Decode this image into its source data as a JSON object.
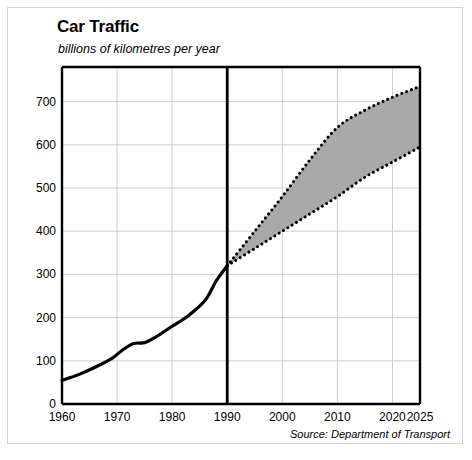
{
  "figure": {
    "title": "Car Traffic",
    "subtitle": "billions of kilometres per year",
    "source": "Source: Department of Transport"
  },
  "chart_data": {
    "type": "area",
    "title": "Car Traffic",
    "subtitle": "billions of kilometres per year",
    "xlabel": "",
    "ylabel": "billions of kilometres per year",
    "xlim": [
      1960,
      2025
    ],
    "ylim": [
      0,
      780
    ],
    "yticks": [
      0,
      100,
      200,
      300,
      400,
      500,
      600,
      700
    ],
    "ytick_labels": [
      "0",
      "100",
      "200",
      "300",
      "400",
      "500",
      "600",
      "700"
    ],
    "xticks": [
      1960,
      1970,
      1980,
      1990,
      2000,
      2010,
      2020,
      2025
    ],
    "xtick_labels": [
      "1960",
      "1970",
      "1980",
      "1990",
      "2000",
      "2010",
      "2020",
      "2025"
    ],
    "grid": true,
    "legend": "none",
    "annotations": [
      {
        "label": "forecast-divider",
        "x": 1990,
        "style": "thick-vertical-line"
      }
    ],
    "series": [
      {
        "name": "Actual car traffic",
        "style": "solid-line",
        "x": [
          1960,
          1963,
          1966,
          1969,
          1971,
          1973,
          1975,
          1977,
          1980,
          1983,
          1986,
          1988,
          1990
        ],
        "values": [
          55,
          68,
          85,
          105,
          125,
          140,
          142,
          155,
          180,
          205,
          240,
          285,
          320
        ]
      },
      {
        "name": "Forecast high",
        "style": "dotted-line",
        "x": [
          1990,
          1995,
          2000,
          2005,
          2010,
          2015,
          2020,
          2025
        ],
        "values": [
          320,
          400,
          480,
          565,
          640,
          680,
          710,
          735
        ]
      },
      {
        "name": "Forecast low",
        "style": "dotted-line",
        "x": [
          1990,
          1995,
          2000,
          2005,
          2010,
          2015,
          2020,
          2025
        ],
        "values": [
          320,
          360,
          400,
          440,
          480,
          525,
          560,
          595
        ]
      }
    ],
    "shaded_band": {
      "between": [
        "Forecast low",
        "Forecast high"
      ],
      "fill_color": "#a9a9a9"
    },
    "colors": {
      "line": "#000000",
      "band_fill": "#a9a9a9",
      "grid": "#cfcfcf",
      "axis": "#000000",
      "border": "#d2d2d2",
      "background": "#ffffff"
    }
  }
}
